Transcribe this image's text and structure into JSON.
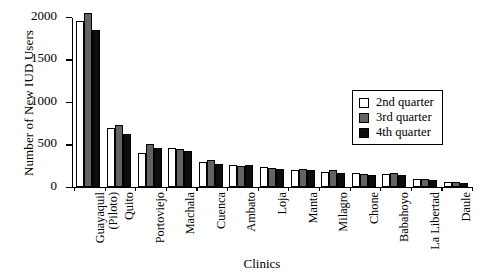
{
  "chart_data": {
    "type": "bar",
    "title": "",
    "xlabel": "Clinics",
    "ylabel": "Number of New IUD Users",
    "ylim": [
      0,
      2000
    ],
    "yticks": [
      0,
      500,
      1000,
      1500,
      2000
    ],
    "grid": false,
    "legend_position": "upper right",
    "categories": [
      "Guayaquil (Piloto)",
      "Quito",
      "Portoviejo",
      "Machala",
      "Cuenca",
      "Ambato",
      "Loja",
      "Manta",
      "Milagro",
      "Chone",
      "Babahoyo",
      "La Libertad",
      "Daule"
    ],
    "category_lines": [
      [
        "Guayaquil",
        "(Piloto)"
      ],
      [
        "Quito"
      ],
      [
        "Portoviejo"
      ],
      [
        "Machala"
      ],
      [
        "Cuenca"
      ],
      [
        "Ambato"
      ],
      [
        "Loja"
      ],
      [
        "Manta"
      ],
      [
        "Milagro"
      ],
      [
        "Chone"
      ],
      [
        "Babahoyo"
      ],
      [
        "La Libertad"
      ],
      [
        "Daule"
      ]
    ],
    "series": [
      {
        "name": "2nd quarter",
        "color": "#ffffff",
        "values": [
          1950,
          700,
          400,
          460,
          300,
          260,
          230,
          205,
          180,
          160,
          150,
          90,
          55
        ]
      },
      {
        "name": "3rd quarter",
        "color": "#636363",
        "values": [
          2050,
          730,
          510,
          450,
          320,
          245,
          225,
          215,
          195,
          150,
          170,
          90,
          55
        ]
      },
      {
        "name": "4th quarter",
        "color": "#0d0d0d",
        "values": [
          1850,
          620,
          460,
          420,
          270,
          260,
          215,
          195,
          165,
          145,
          140,
          85,
          45
        ]
      }
    ]
  },
  "legend": {
    "items": [
      {
        "label": "2nd quarter",
        "swatch": "q2"
      },
      {
        "label": "3rd quarter",
        "swatch": "q3"
      },
      {
        "label": "4th quarter",
        "swatch": "q4"
      }
    ]
  }
}
